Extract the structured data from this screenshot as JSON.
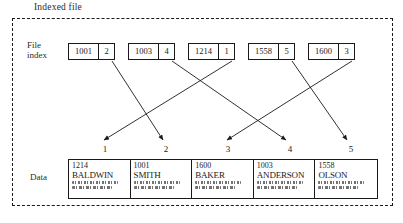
{
  "figure": {
    "caption": "Indexed file",
    "labels": {
      "file_index": "File\nindex",
      "file_index_line1": "File",
      "file_index_line2": "index",
      "data": "Data"
    },
    "colors": {
      "ink": "#1a1a1a",
      "background": "#ffffff"
    }
  },
  "file_index": {
    "entries": [
      {
        "key": "1001",
        "pointer": "2"
      },
      {
        "key": "1003",
        "pointer": "4"
      },
      {
        "key": "1214",
        "pointer": "1"
      },
      {
        "key": "1558",
        "pointer": "5"
      },
      {
        "key": "1600",
        "pointer": "3"
      }
    ]
  },
  "data_slots": {
    "numbers": [
      "1",
      "2",
      "3",
      "4",
      "5"
    ],
    "records": [
      {
        "slot": "1",
        "id": "1214",
        "name": "BALDWIN"
      },
      {
        "slot": "2",
        "id": "1001",
        "name": "SMITH"
      },
      {
        "slot": "3",
        "id": "1600",
        "name": "BAKER"
      },
      {
        "slot": "4",
        "id": "1003",
        "name": "ANDERSON"
      },
      {
        "slot": "5",
        "id": "1558",
        "name": "OLSON"
      }
    ]
  },
  "links": [
    {
      "from_key": "1001",
      "to_slot": "2"
    },
    {
      "from_key": "1003",
      "to_slot": "4"
    },
    {
      "from_key": "1214",
      "to_slot": "1"
    },
    {
      "from_key": "1558",
      "to_slot": "5"
    },
    {
      "from_key": "1600",
      "to_slot": "3"
    }
  ]
}
